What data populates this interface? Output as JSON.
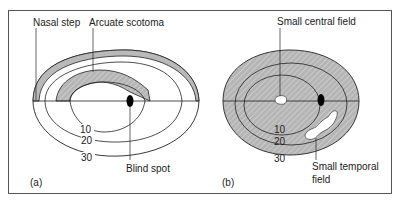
{
  "figure": {
    "panel_a": {
      "tag": "(a)",
      "labels": {
        "nasal_step": "Nasal step",
        "arcuate_scotoma": "Arcuate scotoma",
        "blind_spot": "Blind spot"
      },
      "isopters": [
        "10",
        "20",
        "30"
      ]
    },
    "panel_b": {
      "tag": "(b)",
      "labels": {
        "small_central_field": "Small central field",
        "small_temporal_field_line1": "Small temporal",
        "small_temporal_field_line2": "field"
      },
      "isopters": [
        "10",
        "20",
        "30"
      ]
    },
    "colors": {
      "shade": "#b9b9b9",
      "stroke": "#222222",
      "frame": "#555555"
    }
  }
}
